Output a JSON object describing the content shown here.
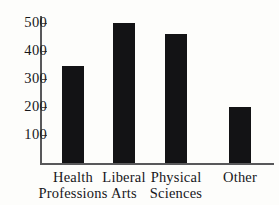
{
  "chart_data": {
    "type": "bar",
    "title": "",
    "xlabel": "",
    "ylabel": "",
    "categories": [
      "Health Professions",
      "Liberal Arts",
      "Physical Sciences",
      "Other"
    ],
    "category_lines": [
      [
        "Health",
        "Professions"
      ],
      [
        "Liberal",
        "Arts"
      ],
      [
        "Physical",
        "Sciences"
      ],
      [
        "Other"
      ]
    ],
    "values": [
      345,
      500,
      460,
      200
    ],
    "ylim": [
      0,
      540
    ],
    "yticks": [
      100,
      200,
      300,
      400,
      500
    ],
    "ytick_labels": [
      "100",
      "200",
      "300",
      "400",
      "500"
    ],
    "grid": false,
    "legend": false,
    "bar_color": "#131315",
    "axis_color": "#58585a",
    "background_color": "#fdfdfb",
    "text_color": "#17171a"
  }
}
